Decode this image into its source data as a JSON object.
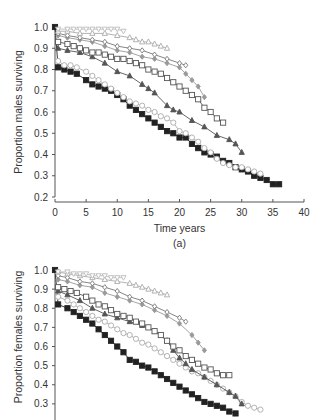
{
  "chart_data": [
    {
      "type": "line",
      "panel_label": "(a)",
      "title": "",
      "xlabel": "Time years",
      "ylabel": "Proportion males surviving",
      "xlim": [
        0,
        40
      ],
      "ylim": [
        0.2,
        1.0
      ],
      "xticks": [
        0,
        5,
        10,
        15,
        20,
        25,
        30,
        35,
        40
      ],
      "yticks": [
        "0.2",
        "0.3",
        "0.4",
        "0.5",
        "0.6",
        "0.7",
        "0.8",
        "0.9",
        "1.0"
      ],
      "grid": false,
      "legend": "none",
      "series": [
        {
          "name": "series-1",
          "marker": "filled-square",
          "color": "#222222",
          "fill": "#222222",
          "x": [
            0,
            0.5,
            1.5,
            2.5,
            3.5,
            5,
            6,
            7,
            8,
            9,
            10,
            11,
            12,
            13,
            14,
            15,
            16,
            17,
            18,
            19,
            20,
            21,
            22,
            23,
            24,
            25,
            26,
            27,
            28,
            29,
            30,
            31,
            32,
            33,
            34,
            35,
            36
          ],
          "y": [
            1.0,
            0.81,
            0.8,
            0.79,
            0.78,
            0.75,
            0.73,
            0.72,
            0.71,
            0.7,
            0.68,
            0.66,
            0.63,
            0.61,
            0.59,
            0.57,
            0.55,
            0.53,
            0.51,
            0.5,
            0.48,
            0.48,
            0.45,
            0.43,
            0.41,
            0.4,
            0.39,
            0.37,
            0.36,
            0.34,
            0.33,
            0.32,
            0.3,
            0.29,
            0.28,
            0.26,
            0.26
          ]
        },
        {
          "name": "series-2",
          "marker": "open-circle",
          "color": "#aaaaaa",
          "fill": "#ffffff",
          "x": [
            0.5,
            1.5,
            2.5,
            3.5,
            5,
            6,
            7,
            8,
            9,
            10,
            11,
            12,
            13,
            14,
            15,
            16,
            17,
            18,
            19,
            20,
            21,
            22,
            23,
            24,
            25,
            26,
            27,
            28,
            29,
            30,
            31,
            32,
            33
          ],
          "y": [
            0.84,
            0.82,
            0.82,
            0.81,
            0.79,
            0.77,
            0.75,
            0.73,
            0.71,
            0.69,
            0.67,
            0.65,
            0.64,
            0.63,
            0.61,
            0.6,
            0.58,
            0.57,
            0.55,
            0.51,
            0.5,
            0.48,
            0.46,
            0.43,
            0.41,
            0.38,
            0.36,
            0.35,
            0.34,
            0.34,
            0.33,
            0.32,
            0.31
          ]
        },
        {
          "name": "series-3",
          "marker": "filled-triangle",
          "color": "#555555",
          "fill": "#555555",
          "x": [
            0.5,
            2,
            4,
            6,
            8,
            10,
            12,
            14,
            15,
            16,
            18,
            19,
            20,
            22,
            24,
            26,
            28,
            29,
            30
          ],
          "y": [
            0.9,
            0.89,
            0.88,
            0.86,
            0.83,
            0.79,
            0.77,
            0.73,
            0.71,
            0.69,
            0.63,
            0.61,
            0.6,
            0.56,
            0.53,
            0.49,
            0.47,
            0.45,
            0.41
          ]
        },
        {
          "name": "series-4",
          "marker": "open-square",
          "color": "#555555",
          "fill": "#ffffff",
          "x": [
            0.5,
            2,
            3,
            4,
            5,
            6,
            7,
            8,
            9,
            10,
            11,
            12,
            13,
            14,
            15,
            16,
            17,
            18,
            19,
            20,
            21,
            22,
            23,
            24,
            25,
            26,
            27
          ],
          "y": [
            0.93,
            0.92,
            0.91,
            0.9,
            0.89,
            0.88,
            0.88,
            0.87,
            0.86,
            0.85,
            0.85,
            0.84,
            0.83,
            0.82,
            0.8,
            0.79,
            0.78,
            0.76,
            0.74,
            0.72,
            0.7,
            0.68,
            0.66,
            0.62,
            0.6,
            0.57,
            0.55
          ]
        },
        {
          "name": "series-5",
          "marker": "filled-diamond",
          "color": "#999999",
          "fill": "#999999",
          "x": [
            0.5,
            2,
            4,
            6,
            8,
            10,
            12,
            14,
            16,
            18,
            20,
            21,
            22,
            23,
            24
          ],
          "y": [
            0.96,
            0.95,
            0.94,
            0.93,
            0.91,
            0.89,
            0.88,
            0.86,
            0.85,
            0.83,
            0.81,
            0.78,
            0.75,
            0.72,
            0.67
          ]
        },
        {
          "name": "series-6",
          "marker": "open-diamond",
          "color": "#777777",
          "fill": "#ffffff",
          "x": [
            0.5,
            2,
            4,
            6,
            8,
            10,
            12,
            14,
            16,
            18,
            20,
            21
          ],
          "y": [
            0.97,
            0.96,
            0.95,
            0.94,
            0.93,
            0.91,
            0.9,
            0.89,
            0.87,
            0.85,
            0.83,
            0.82
          ]
        },
        {
          "name": "series-7",
          "marker": "open-triangle",
          "color": "#aaaaaa",
          "fill": "#ffffff",
          "x": [
            0.5,
            2,
            4,
            6,
            8,
            10,
            12,
            13,
            14,
            15,
            16,
            17,
            18
          ],
          "y": [
            0.98,
            0.98,
            0.97,
            0.97,
            0.97,
            0.96,
            0.95,
            0.94,
            0.93,
            0.93,
            0.92,
            0.91,
            0.9
          ]
        },
        {
          "name": "series-8",
          "marker": "open-inverted-triangle",
          "color": "#bbbbbb",
          "fill": "#ffffff",
          "x": [
            0.5,
            2,
            3,
            4,
            5,
            6,
            7,
            8,
            9,
            10,
            11
          ],
          "y": [
            0.99,
            0.99,
            0.99,
            0.99,
            0.99,
            0.99,
            0.99,
            0.99,
            0.99,
            0.99,
            0.98
          ]
        }
      ]
    },
    {
      "type": "line",
      "panel_label": "(b)",
      "title": "",
      "xlabel": "",
      "ylabel": "Proportion females surviving",
      "xlim": [
        0,
        40
      ],
      "ylim": [
        0.2,
        1.0
      ],
      "yticks": [
        "0.2",
        "0.3",
        "0.4",
        "0.5",
        "0.6",
        "0.7",
        "0.8",
        "0.9",
        "1.0"
      ],
      "grid": false,
      "legend": "none",
      "series": [
        {
          "name": "series-1",
          "marker": "filled-square",
          "color": "#222222",
          "fill": "#222222",
          "x": [
            0,
            0.5,
            2,
            3,
            4,
            5,
            6,
            7,
            8,
            9,
            10,
            11,
            12,
            13,
            14,
            15,
            16,
            17,
            18,
            19,
            20,
            21,
            22,
            23,
            24,
            25,
            26,
            27,
            28,
            29
          ],
          "y": [
            1.0,
            0.82,
            0.8,
            0.78,
            0.76,
            0.74,
            0.72,
            0.69,
            0.66,
            0.63,
            0.6,
            0.57,
            0.53,
            0.52,
            0.5,
            0.49,
            0.47,
            0.45,
            0.43,
            0.41,
            0.39,
            0.37,
            0.35,
            0.33,
            0.31,
            0.3,
            0.29,
            0.28,
            0.26,
            0.25
          ]
        },
        {
          "name": "series-2",
          "marker": "open-circle",
          "color": "#aaaaaa",
          "fill": "#ffffff",
          "x": [
            0.5,
            2,
            3,
            4,
            5,
            6,
            7,
            8,
            9,
            10,
            11,
            12,
            13,
            14,
            15,
            16,
            17,
            18,
            19,
            20,
            21,
            22,
            23,
            24,
            25,
            26,
            27,
            28,
            29,
            30,
            31,
            32,
            33
          ],
          "y": [
            0.86,
            0.84,
            0.82,
            0.8,
            0.78,
            0.76,
            0.74,
            0.73,
            0.71,
            0.69,
            0.67,
            0.66,
            0.64,
            0.62,
            0.61,
            0.59,
            0.57,
            0.55,
            0.53,
            0.51,
            0.49,
            0.47,
            0.46,
            0.44,
            0.42,
            0.4,
            0.38,
            0.36,
            0.34,
            0.31,
            0.29,
            0.28,
            0.27
          ]
        },
        {
          "name": "series-3",
          "marker": "filled-triangle",
          "color": "#555555",
          "fill": "#555555",
          "x": [
            0.5,
            2,
            4,
            6,
            8,
            10,
            12,
            14,
            16,
            18,
            19,
            20,
            21,
            22,
            24,
            26,
            28,
            29,
            30
          ],
          "y": [
            0.89,
            0.87,
            0.84,
            0.8,
            0.77,
            0.75,
            0.73,
            0.71,
            0.68,
            0.63,
            0.58,
            0.54,
            0.51,
            0.48,
            0.44,
            0.4,
            0.36,
            0.34,
            0.3
          ]
        },
        {
          "name": "series-4",
          "marker": "open-square",
          "color": "#555555",
          "fill": "#ffffff",
          "x": [
            0.5,
            1.5,
            2.5,
            3.5,
            5,
            6,
            7,
            8,
            9,
            10,
            11,
            12,
            13,
            14,
            15,
            16,
            17,
            18,
            19,
            20,
            21,
            22,
            23,
            24,
            25,
            26,
            27,
            28
          ],
          "y": [
            0.91,
            0.9,
            0.89,
            0.88,
            0.86,
            0.84,
            0.82,
            0.81,
            0.79,
            0.77,
            0.76,
            0.75,
            0.73,
            0.72,
            0.7,
            0.68,
            0.66,
            0.63,
            0.6,
            0.58,
            0.55,
            0.53,
            0.51,
            0.49,
            0.48,
            0.46,
            0.45,
            0.45
          ]
        },
        {
          "name": "series-5",
          "marker": "filled-diamond",
          "color": "#999999",
          "fill": "#999999",
          "x": [
            0.5,
            2,
            4,
            6,
            8,
            10,
            12,
            14,
            16,
            18,
            20,
            22,
            23,
            24
          ],
          "y": [
            0.95,
            0.94,
            0.92,
            0.91,
            0.88,
            0.86,
            0.84,
            0.82,
            0.79,
            0.76,
            0.72,
            0.66,
            0.62,
            0.58
          ]
        },
        {
          "name": "series-6",
          "marker": "open-diamond",
          "color": "#777777",
          "fill": "#ffffff",
          "x": [
            0.5,
            2,
            4,
            6,
            8,
            10,
            12,
            14,
            16,
            18,
            20,
            21
          ],
          "y": [
            0.97,
            0.96,
            0.94,
            0.93,
            0.91,
            0.89,
            0.86,
            0.84,
            0.81,
            0.78,
            0.75,
            0.73
          ]
        },
        {
          "name": "series-7",
          "marker": "open-triangle",
          "color": "#aaaaaa",
          "fill": "#ffffff",
          "x": [
            0.5,
            2,
            4,
            6,
            8,
            10,
            12,
            13,
            14,
            15,
            16,
            17,
            18
          ],
          "y": [
            0.99,
            0.98,
            0.97,
            0.96,
            0.95,
            0.94,
            0.93,
            0.92,
            0.91,
            0.9,
            0.89,
            0.88,
            0.87
          ]
        },
        {
          "name": "series-8",
          "marker": "open-inverted-triangle",
          "color": "#bbbbbb",
          "fill": "#ffffff",
          "x": [
            0.5,
            2,
            3,
            4,
            5,
            6,
            7,
            8,
            9,
            10,
            11
          ],
          "y": [
            0.99,
            0.99,
            0.98,
            0.98,
            0.98,
            0.97,
            0.97,
            0.97,
            0.96,
            0.96,
            0.96
          ]
        }
      ]
    }
  ]
}
